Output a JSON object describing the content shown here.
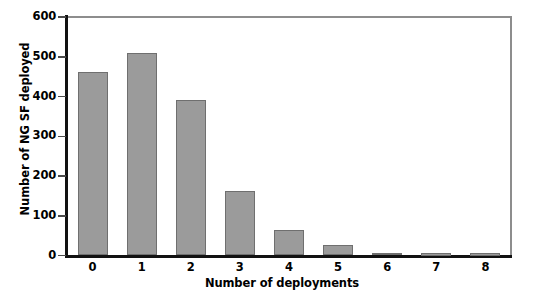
{
  "chart_data": {
    "type": "bar",
    "title": "",
    "subtitle": "",
    "xlabel": "Number of deployments",
    "ylabel": "Number of NG SF deployed",
    "categories": [
      "0",
      "1",
      "2",
      "3",
      "4",
      "5",
      "6",
      "7",
      "8"
    ],
    "values": [
      462,
      510,
      392,
      162,
      65,
      26,
      7,
      5,
      5
    ],
    "series": [
      {
        "name": "Number of NG SF deployed",
        "values": [
          462,
          510,
          392,
          162,
          65,
          26,
          7,
          5,
          5
        ]
      }
    ],
    "ylim": [
      0,
      600
    ],
    "ytick_labels": [
      "0",
      "100",
      "200",
      "300",
      "400",
      "500",
      "600"
    ],
    "ytick_values": [
      0,
      100,
      200,
      300,
      400,
      500,
      600
    ],
    "xtick_labels": [
      "0",
      "1",
      "2",
      "3",
      "4",
      "5",
      "6",
      "7",
      "8"
    ],
    "grid": false,
    "legend": false,
    "legend_position": "none",
    "bar_color": "#9b9b9b",
    "bar_edge_color": "#6f6f6f",
    "axis_color": "#111111",
    "frame_color": "#8d8d8d",
    "background_color": "#ffffff"
  }
}
